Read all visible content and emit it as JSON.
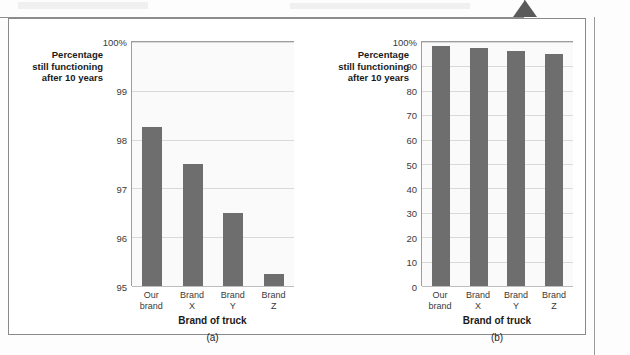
{
  "figure": {
    "marker_icon": "up-triangle-marker",
    "panels": [
      {
        "id": "a",
        "caption": "(a)",
        "ylabel": "Percentage\nstill functioning\nafter 10 years",
        "xlabel": "Brand of truck",
        "yticks": [
          "100%",
          "99",
          "98",
          "97",
          "96",
          "95"
        ]
      },
      {
        "id": "b",
        "caption": "(b)",
        "ylabel": "Percentage\nstill functioning\nafter 10 years",
        "xlabel": "Brand of truck",
        "yticks": [
          "100%",
          "90",
          "80",
          "70",
          "60",
          "50",
          "40",
          "30",
          "20",
          "10",
          "0"
        ]
      }
    ]
  },
  "chart_data": [
    {
      "type": "bar",
      "panel": "(a)",
      "title": "",
      "categories": [
        "Our\nbrand",
        "Brand\nX",
        "Brand\nY",
        "Brand\nZ"
      ],
      "values": [
        98.25,
        97.5,
        96.5,
        95.25
      ],
      "xlabel": "Brand of truck",
      "ylabel": "Percentage still functioning after 10 years",
      "ylim": [
        95,
        100
      ],
      "ytick_step": 1,
      "ytick_labels": [
        "95",
        "96",
        "97",
        "98",
        "99",
        "100%"
      ],
      "grid": true,
      "legend": "none",
      "bar_color": "#6e6e6e",
      "plot_bg": "#fafafa",
      "note": "Truncated y-axis exaggerates differences between brands"
    },
    {
      "type": "bar",
      "panel": "(b)",
      "title": "",
      "categories": [
        "Our\nbrand",
        "Brand\nX",
        "Brand\nY",
        "Brand\nZ"
      ],
      "values": [
        98.25,
        97.5,
        96.5,
        95.25
      ],
      "xlabel": "Brand of truck",
      "ylabel": "Percentage still functioning after 10 years",
      "ylim": [
        0,
        100
      ],
      "ytick_step": 10,
      "ytick_labels": [
        "0",
        "10",
        "20",
        "30",
        "40",
        "50",
        "60",
        "70",
        "80",
        "90",
        "100%"
      ],
      "grid": true,
      "legend": "none",
      "bar_color": "#6e6e6e",
      "plot_bg": "#fafafa",
      "note": "Full y-axis from zero shows brands are nearly identical"
    }
  ]
}
